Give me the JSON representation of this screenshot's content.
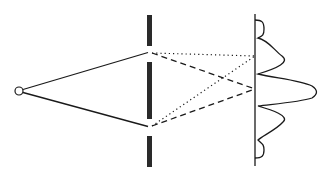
{
  "diagram": {
    "title": "",
    "type": "double-slit interference",
    "colors": {
      "stroke": "#1a1a1a",
      "barrier": "#2a2a2a",
      "background": "#ffffff"
    },
    "elements": [
      {
        "name": "light-source",
        "shape": "circle"
      },
      {
        "name": "barrier",
        "shape": "wall with two slits"
      },
      {
        "name": "screen",
        "shape": "vertical line"
      },
      {
        "name": "intensity-pattern",
        "shape": "interference fringe curve"
      },
      {
        "name": "solid-rays",
        "style": "solid"
      },
      {
        "name": "dotted-paths",
        "style": "dotted"
      },
      {
        "name": "dashed-paths",
        "style": "dashed"
      }
    ]
  }
}
